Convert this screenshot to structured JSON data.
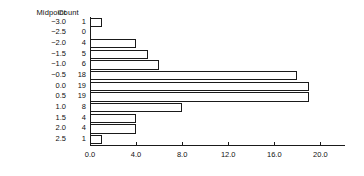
{
  "table": {
    "midpoint_header": "Midpoint",
    "count_header": "Count"
  },
  "chart_data": {
    "type": "bar",
    "orientation": "horizontal",
    "title": "",
    "xlabel": "",
    "ylabel": "Midpoint",
    "categories": [
      "-3.0",
      "-2.5",
      "-2.0",
      "-1.5",
      "-1.0",
      "-0.5",
      "0.0",
      "0.5",
      "1.0",
      "1.5",
      "2.0",
      "2.5"
    ],
    "values": [
      1,
      0,
      4,
      5,
      6,
      18,
      19,
      19,
      8,
      4,
      4,
      1
    ],
    "count_labels": [
      "1",
      "0",
      "4",
      "5",
      "6",
      "18",
      "19",
      "19",
      "8",
      "4",
      "4",
      "1"
    ],
    "xlim": [
      0,
      22.2
    ],
    "xticks": [
      0,
      4,
      8,
      12,
      16,
      20
    ],
    "xtick_labels": [
      "0.0",
      "4.0",
      "8.0",
      "12.0",
      "16.0",
      "20.0"
    ],
    "grid": false,
    "legend": null,
    "bar_fill": "#ffffff",
    "bar_stroke": "#1a1a1a",
    "axis_color": "#1a1a1a",
    "background": "#ffffff"
  }
}
